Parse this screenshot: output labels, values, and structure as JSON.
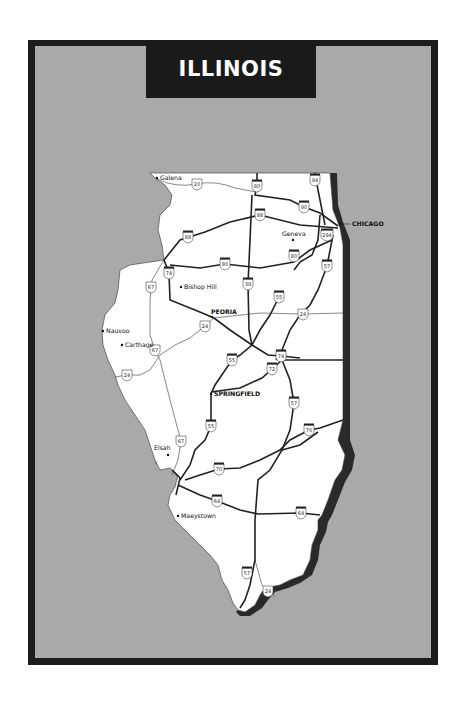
{
  "title": "ILLINOIS",
  "colors": {
    "frame": "#1c1c1c",
    "background_panel": "#a9a9a9",
    "state_fill": "#ffffff",
    "state_shadow": "#2a2a2a",
    "title_text": "#ffffff"
  },
  "cities": [
    {
      "name": "Galena",
      "x": 157,
      "y": 178,
      "style": "normal"
    },
    {
      "name": "Geneva",
      "x": 293,
      "y": 240,
      "style": "normal"
    },
    {
      "name": "CHICAGO",
      "x": 352,
      "y": 224,
      "style": "bold"
    },
    {
      "name": "Bishop Hill",
      "x": 181,
      "y": 287,
      "style": "normal"
    },
    {
      "name": "PEORIA",
      "x": 212,
      "y": 317,
      "style": "bold"
    },
    {
      "name": "Nauvoo",
      "x": 103,
      "y": 331,
      "style": "normal"
    },
    {
      "name": "Carthage",
      "x": 122,
      "y": 345,
      "style": "normal"
    },
    {
      "name": "SPRINGFIELD",
      "x": 211,
      "y": 394,
      "style": "bold"
    },
    {
      "name": "Elsah",
      "x": 168,
      "y": 455,
      "style": "normal"
    },
    {
      "name": "Maeystown",
      "x": 178,
      "y": 516,
      "style": "normal"
    }
  ],
  "route_shields": [
    {
      "label": "20",
      "type": "us",
      "x": 197,
      "y": 184
    },
    {
      "label": "80",
      "type": "interstate",
      "x": 257,
      "y": 186
    },
    {
      "label": "94",
      "type": "interstate",
      "x": 315,
      "y": 180
    },
    {
      "label": "90",
      "type": "interstate",
      "x": 304,
      "y": 207
    },
    {
      "label": "88",
      "type": "interstate",
      "x": 260,
      "y": 215
    },
    {
      "label": "88",
      "type": "interstate",
      "x": 188,
      "y": 237
    },
    {
      "label": "294",
      "type": "interstate",
      "x": 327,
      "y": 235
    },
    {
      "label": "80",
      "type": "interstate",
      "x": 225,
      "y": 264
    },
    {
      "label": "80",
      "type": "interstate",
      "x": 294,
      "y": 256
    },
    {
      "label": "57",
      "type": "interstate",
      "x": 327,
      "y": 266
    },
    {
      "label": "74",
      "type": "interstate",
      "x": 169,
      "y": 273
    },
    {
      "label": "67",
      "type": "us",
      "x": 151,
      "y": 287
    },
    {
      "label": "39",
      "type": "interstate",
      "x": 248,
      "y": 284
    },
    {
      "label": "55",
      "type": "interstate",
      "x": 279,
      "y": 297
    },
    {
      "label": "24",
      "type": "us",
      "x": 303,
      "y": 314
    },
    {
      "label": "24",
      "type": "us",
      "x": 205,
      "y": 326
    },
    {
      "label": "67",
      "type": "us",
      "x": 155,
      "y": 350
    },
    {
      "label": "55",
      "type": "interstate",
      "x": 232,
      "y": 360
    },
    {
      "label": "74",
      "type": "interstate",
      "x": 281,
      "y": 356
    },
    {
      "label": "72",
      "type": "interstate",
      "x": 272,
      "y": 369
    },
    {
      "label": "24",
      "type": "us",
      "x": 127,
      "y": 375
    },
    {
      "label": "57",
      "type": "interstate",
      "x": 294,
      "y": 403
    },
    {
      "label": "55",
      "type": "interstate",
      "x": 211,
      "y": 426
    },
    {
      "label": "70",
      "type": "interstate",
      "x": 309,
      "y": 430
    },
    {
      "label": "67",
      "type": "us",
      "x": 181,
      "y": 441
    },
    {
      "label": "70",
      "type": "interstate",
      "x": 219,
      "y": 469
    },
    {
      "label": "64",
      "type": "interstate",
      "x": 217,
      "y": 501
    },
    {
      "label": "64",
      "type": "interstate",
      "x": 301,
      "y": 513
    },
    {
      "label": "57",
      "type": "interstate",
      "x": 247,
      "y": 573
    },
    {
      "label": "24",
      "type": "us",
      "x": 268,
      "y": 591
    }
  ]
}
